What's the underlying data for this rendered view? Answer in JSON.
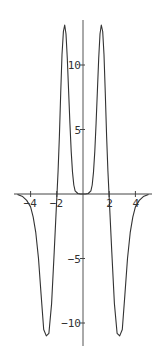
{
  "chart_data": {
    "type": "line",
    "title": "",
    "xlabel": "",
    "ylabel": "",
    "xlim": [
      -5.2,
      5.2
    ],
    "ylim": [
      -11.7,
      13.4
    ],
    "grid": false,
    "legend": null,
    "x_ticks": [
      {
        "value": -4,
        "label": "-4"
      },
      {
        "value": -2,
        "label": "-2"
      },
      {
        "value": 2,
        "label": "2"
      },
      {
        "value": 4,
        "label": "4"
      }
    ],
    "y_ticks": [
      {
        "value": 10,
        "label": "10"
      },
      {
        "value": 5,
        "label": "5"
      },
      {
        "value": -5,
        "label": "-5"
      },
      {
        "value": -10,
        "label": "-10"
      }
    ],
    "series": [
      {
        "name": "f(x)",
        "color": "#333333",
        "x": [
          -5.0,
          -4.6,
          -4.3,
          -4.0,
          -3.8,
          -3.6,
          -3.4,
          -3.2,
          -3.0,
          -2.8,
          -2.6,
          -2.4,
          -2.2,
          -2.0,
          -1.9,
          -1.8,
          -1.7,
          -1.6,
          -1.5,
          -1.4,
          -1.3,
          -1.2,
          -1.1,
          -1.0,
          -0.9,
          -0.8,
          -0.7,
          -0.6,
          -0.4,
          -0.2,
          0.0,
          0.2,
          0.4,
          0.6,
          0.7,
          0.8,
          0.9,
          1.0,
          1.1,
          1.2,
          1.3,
          1.4,
          1.5,
          1.6,
          1.7,
          1.8,
          1.9,
          2.0,
          2.2,
          2.4,
          2.6,
          2.8,
          3.0,
          3.2,
          3.4,
          3.6,
          3.8,
          4.0,
          4.3,
          4.6,
          5.0
        ],
        "y": [
          -0.05,
          -0.2,
          -0.5,
          -1.0,
          -1.8,
          -3.0,
          -5.0,
          -7.8,
          -10.5,
          -11.0,
          -10.8,
          -8.5,
          -4.5,
          -0.3,
          1.8,
          4.5,
          7.8,
          10.8,
          12.6,
          13.1,
          12.4,
          10.5,
          8.0,
          5.5,
          3.3,
          1.7,
          0.7,
          0.25,
          0.04,
          0.0,
          0.0,
          0.0,
          0.04,
          0.25,
          0.7,
          1.7,
          3.3,
          5.5,
          8.0,
          10.5,
          12.4,
          13.1,
          12.6,
          10.8,
          7.8,
          4.5,
          1.8,
          -0.3,
          -4.5,
          -8.5,
          -10.8,
          -11.0,
          -10.5,
          -7.8,
          -5.0,
          -3.0,
          -1.8,
          -1.0,
          -0.5,
          -0.2,
          -0.05
        ]
      }
    ]
  }
}
